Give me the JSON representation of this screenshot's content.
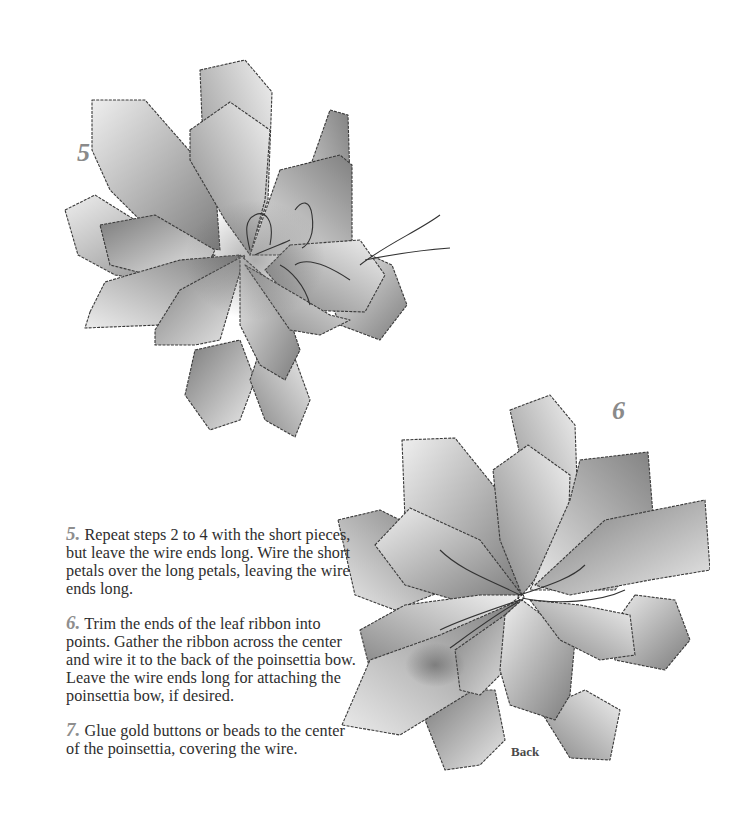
{
  "figures": [
    {
      "id": "figure-5",
      "number": "5",
      "caption": ""
    },
    {
      "id": "figure-6",
      "number": "6",
      "caption": "Back"
    }
  ],
  "steps": [
    {
      "number": "5.",
      "text": "Repeat steps 2 to 4 with the short pieces, but leave the wire ends long. Wire the short petals over the long petals, leaving the wire ends long."
    },
    {
      "number": "6.",
      "text": "Trim the ends of the leaf ribbon into points. Gather the ribbon across the center and wire it to the back of the poinsettia bow. Leave the wire ends long for attaching the poinsettia bow, if desired."
    },
    {
      "number": "7.",
      "text": "Glue gold buttons or beads to the center of the poinsettia, covering the wire."
    }
  ],
  "colors": {
    "step_number": "#8e8e8e",
    "body_text": "#2e2e2e",
    "petal_light": "#e6e6e6",
    "petal_dark": "#7a7a7a",
    "background": "#ffffff"
  }
}
